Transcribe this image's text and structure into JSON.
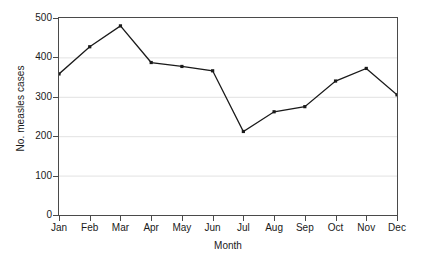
{
  "chart_data": {
    "type": "line",
    "title": "",
    "xlabel": "Month",
    "ylabel": "No. measles cases",
    "categories": [
      "Jan",
      "Feb",
      "Mar",
      "Apr",
      "May",
      "Jun",
      "Jul",
      "Aug",
      "Sep",
      "Oct",
      "Nov",
      "Dec"
    ],
    "values": [
      358,
      427,
      480,
      387,
      377,
      366,
      212,
      262,
      275,
      340,
      372,
      305
    ],
    "series": [
      {
        "name": "No. measles cases",
        "values": [
          358,
          427,
          480,
          387,
          377,
          366,
          212,
          262,
          275,
          340,
          372,
          305
        ]
      }
    ],
    "ylim": [
      0,
      500
    ],
    "ytick_values": [
      0,
      100,
      200,
      300,
      400,
      500
    ],
    "ytick_labels": [
      "0",
      "100",
      "200",
      "300",
      "400",
      "500"
    ],
    "grid": "horizontal",
    "legend": "none",
    "marker": "square",
    "line_color": "#1a1a1a",
    "grid_color": "#e2e2e2",
    "axis_color": "#4a4a4a",
    "background": "#ffffff"
  }
}
